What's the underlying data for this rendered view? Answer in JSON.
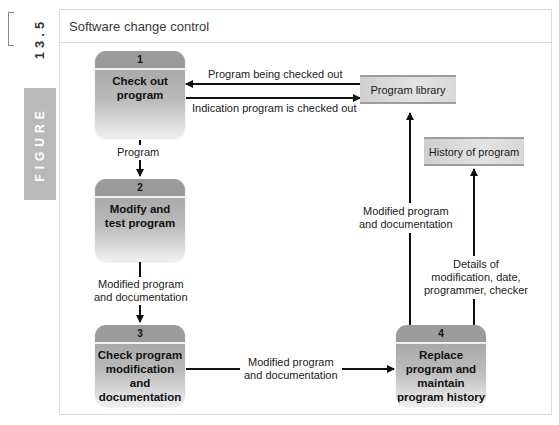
{
  "figure": {
    "number": "13.5",
    "tab_label": "FIGURE"
  },
  "diagram": {
    "title": "Software change control",
    "processes": [
      {
        "num": "1",
        "label": "Check out program"
      },
      {
        "num": "2",
        "label": "Modify and test program"
      },
      {
        "num": "3",
        "label": "Check program modification and documentation"
      },
      {
        "num": "4",
        "label": "Replace program and maintain program history"
      }
    ],
    "stores": [
      {
        "label": "Program library"
      },
      {
        "label": "History of program"
      }
    ],
    "flows": [
      {
        "label": "Program being checked out",
        "from": "Program library",
        "to": "Check out program"
      },
      {
        "label": "Indication program is checked out",
        "from": "Check out program",
        "to": "Program library"
      },
      {
        "label": "Program",
        "from": "Check out program",
        "to": "Modify and test program"
      },
      {
        "label": "Modified program and documentation",
        "from": "Modify and test program",
        "to": "Check program modification and documentation"
      },
      {
        "label": "Modified program and documentation",
        "from": "Check program modification and documentation",
        "to": "Replace program and maintain program history"
      },
      {
        "label": "Modified program and documentation",
        "from": "Replace program and maintain program history",
        "to": "Program library"
      },
      {
        "label": "Details of modification, date, programmer, checker",
        "from": "Replace program and maintain program history",
        "to": "History of program"
      }
    ],
    "flow_labels_lines": {
      "f3_l1": "Modified program",
      "f3_l2": "and documentation",
      "f4_l1": "Modified program",
      "f4_l2": "and documentation",
      "f5_l1": "Modified program",
      "f5_l2": "and documentation",
      "f6_l1": "Details of",
      "f6_l2": "modification, date,",
      "f6_l3": "programmer, checker"
    },
    "process_lines": {
      "p1_l1": "Check out",
      "p1_l2": "program",
      "p2_l1": "Modify and",
      "p2_l2": "test program",
      "p3_l1": "Check program",
      "p3_l2": "modification",
      "p3_l3": "and",
      "p3_l4": "documentation",
      "p4_l1": "Replace",
      "p4_l2": "program and",
      "p4_l3": "maintain",
      "p4_l4": "program history"
    }
  },
  "colors": {
    "process_header": "#9b9b9b",
    "process_body_top": "#a9a9a9",
    "store_fill": "#dcdcdc",
    "figure_tab": "#b9b9b9",
    "arrow": "#111111"
  }
}
